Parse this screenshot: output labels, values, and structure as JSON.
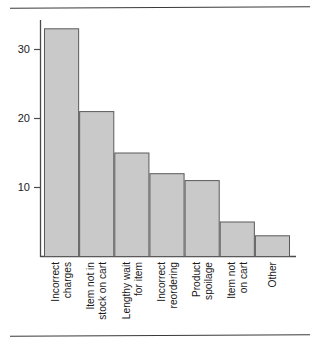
{
  "chart_data": {
    "type": "bar",
    "title": "",
    "subtitle": "",
    "xlabel": "",
    "ylabel": "",
    "categories": [
      "Incorrect charges",
      "Item not in stock on cart",
      "Lengthy wait for item",
      "Incorrect reordering",
      "Product spoilage",
      "Item not on cart",
      "Other"
    ],
    "category_lines": [
      [
        "Incorrect",
        "charges"
      ],
      [
        "Item not in",
        "stock on cart"
      ],
      [
        "Lengthy wait",
        "for item"
      ],
      [
        "Incorrect",
        "reordering"
      ],
      [
        "Product",
        "spoilage"
      ],
      [
        "Item not",
        "on cart"
      ],
      [
        "Other"
      ]
    ],
    "values": [
      33,
      21,
      15,
      12,
      11,
      5,
      3
    ],
    "ylim": [
      0,
      36
    ],
    "yticks": [
      10,
      20,
      30
    ],
    "ytick_labels": [
      "10",
      "20",
      "30"
    ],
    "grid": false,
    "legend": false,
    "legend_position": "none",
    "bar_fill_color": "#c9c9c9",
    "bar_edge_color": "#5a5a5a",
    "axis_color": "#4a4a4a",
    "label_orientation": "vertical"
  },
  "figure": {
    "top_rule": "",
    "bottom_rule": ""
  }
}
